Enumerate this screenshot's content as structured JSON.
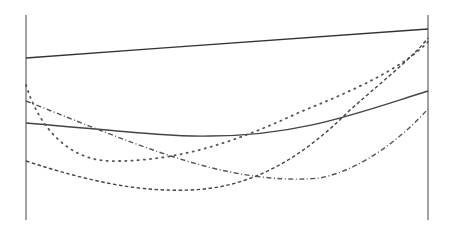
{
  "chart_data": {
    "type": "line",
    "title": "",
    "xlabel": "",
    "ylabel": "",
    "legend": [],
    "grid": false,
    "axes": {
      "left": {
        "x": 26,
        "y_top": 15,
        "y_bottom": 220,
        "color": "#8a8a8a"
      },
      "right": {
        "x": 428,
        "y_top": 15,
        "y_bottom": 220,
        "color": "#8a8a8a"
      }
    },
    "x": [
      0,
      0.25,
      0.5,
      0.75,
      1.0
    ],
    "ylim": [
      0,
      1
    ],
    "series": [
      {
        "name": "series-1",
        "style": "solid",
        "color": "#333333",
        "values": [
          0.79,
          0.81,
          0.83,
          0.86,
          0.93
        ]
      },
      {
        "name": "series-2",
        "style": "solid",
        "color": "#444444",
        "values": [
          0.47,
          0.43,
          0.41,
          0.45,
          0.63
        ]
      },
      {
        "name": "series-3",
        "style": "dotted",
        "color": "#555555",
        "values": [
          0.66,
          0.3,
          0.35,
          0.56,
          0.87
        ]
      },
      {
        "name": "series-4",
        "style": "dashed",
        "color": "#444444",
        "values": [
          0.29,
          0.15,
          0.17,
          0.43,
          0.89
        ]
      },
      {
        "name": "series-5",
        "style": "dashdot",
        "color": "#555555",
        "values": [
          0.58,
          0.37,
          0.21,
          0.2,
          0.54
        ]
      }
    ],
    "paths": [
      {
        "name": "series-1",
        "d": "M26,58 C160,48 300,38 428,29"
      },
      {
        "name": "series-2",
        "d": "M26,123 C110,130 170,137 210,136 C300,136 360,112 428,91"
      },
      {
        "name": "series-3",
        "d": "M26,85 C40,130 70,160 110,161 C180,162 240,140 300,112 C350,92 400,70 428,42"
      },
      {
        "name": "series-4",
        "d": "M26,161 C90,182 140,192 190,190 C250,188 300,160 350,110 C390,75 415,55 428,38"
      },
      {
        "name": "series-5",
        "d": "M26,101 C100,130 170,160 230,172 C270,180 300,180 320,178 C360,170 400,140 428,109"
      }
    ]
  }
}
